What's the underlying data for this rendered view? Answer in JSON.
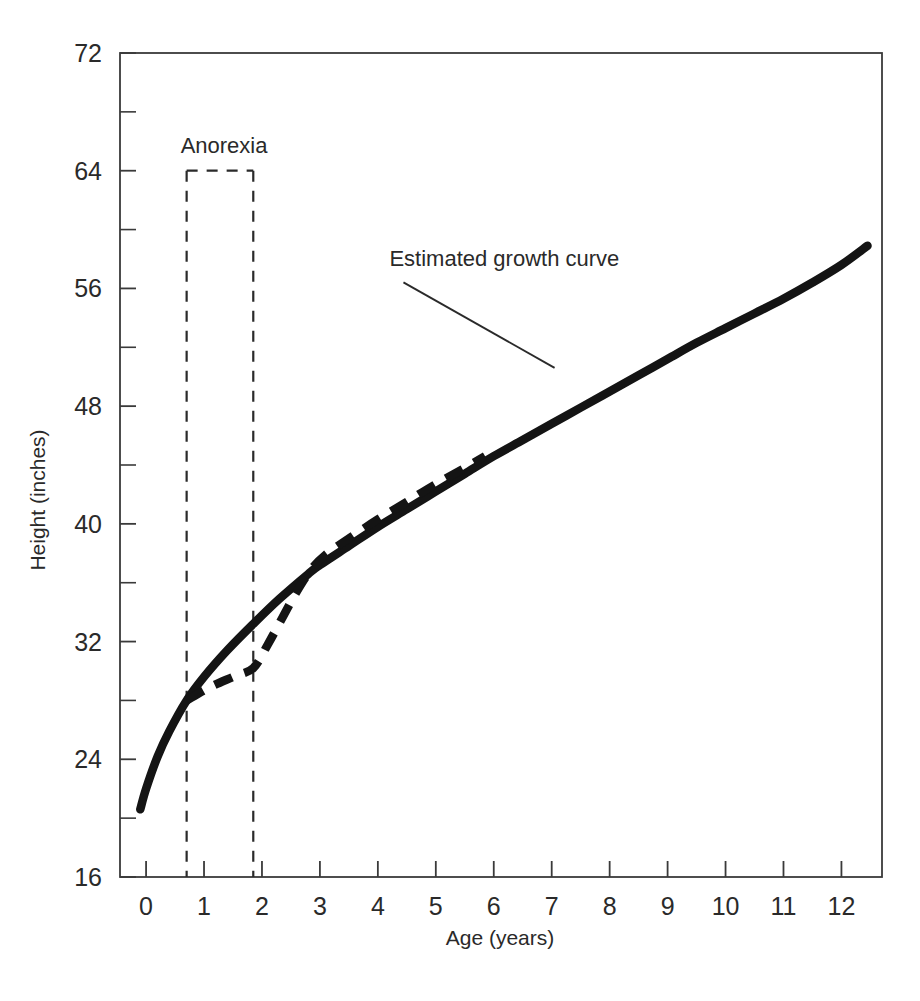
{
  "chart_data": {
    "type": "line",
    "title": "",
    "xlabel": "Age (years)",
    "ylabel": "Height (inches)",
    "xlim": [
      -0.45,
      12.7
    ],
    "ylim": [
      16,
      72
    ],
    "x_ticks": [
      0,
      1,
      2,
      3,
      4,
      5,
      6,
      7,
      8,
      9,
      10,
      11,
      12
    ],
    "x_tick_labels": [
      "0",
      "1",
      "2",
      "3",
      "4",
      "5",
      "6",
      "7",
      "8",
      "9",
      "10",
      "11",
      "12"
    ],
    "y_ticks": [
      16,
      24,
      32,
      40,
      48,
      56,
      64,
      72
    ],
    "y_tick_labels": [
      "16",
      "24",
      "32",
      "40",
      "48",
      "56",
      "64",
      "72"
    ],
    "y_minor_ticks": [
      20,
      28,
      36,
      44,
      52,
      60,
      68
    ],
    "grid": false,
    "legend": "none",
    "series": [
      {
        "name": "Estimated growth curve",
        "style": "solid",
        "color": "#141414",
        "points": [
          [
            -0.1,
            20.6
          ],
          [
            0.0,
            22.0
          ],
          [
            0.2,
            24.2
          ],
          [
            0.4,
            25.9
          ],
          [
            0.7,
            28.0
          ],
          [
            1.0,
            29.6
          ],
          [
            1.4,
            31.4
          ],
          [
            1.85,
            33.2
          ],
          [
            2.3,
            34.9
          ],
          [
            2.8,
            36.6
          ],
          [
            3.0,
            37.2
          ],
          [
            3.5,
            38.5
          ],
          [
            4.0,
            39.8
          ],
          [
            4.5,
            41.0
          ],
          [
            5.0,
            42.2
          ],
          [
            5.5,
            43.4
          ],
          [
            6.0,
            44.6
          ],
          [
            6.5,
            45.7
          ],
          [
            7.0,
            46.8
          ],
          [
            7.5,
            47.9
          ],
          [
            8.0,
            49.0
          ],
          [
            8.5,
            50.1
          ],
          [
            9.0,
            51.2
          ],
          [
            9.5,
            52.3
          ],
          [
            10.0,
            53.3
          ],
          [
            10.5,
            54.3
          ],
          [
            11.0,
            55.3
          ],
          [
            11.5,
            56.4
          ],
          [
            12.0,
            57.6
          ],
          [
            12.45,
            58.9
          ]
        ]
      },
      {
        "name": "Actual growth during anorexia and catch-up",
        "style": "dashed",
        "color": "#141414",
        "points": [
          [
            0.7,
            28.0
          ],
          [
            1.1,
            28.9
          ],
          [
            1.5,
            29.6
          ],
          [
            1.85,
            30.2
          ],
          [
            2.1,
            31.8
          ],
          [
            2.35,
            33.6
          ],
          [
            2.6,
            35.4
          ],
          [
            2.85,
            36.9
          ],
          [
            3.1,
            37.9
          ],
          [
            3.5,
            39.0
          ],
          [
            4.0,
            40.3
          ],
          [
            4.5,
            41.5
          ],
          [
            5.0,
            42.7
          ],
          [
            5.5,
            43.8
          ],
          [
            5.85,
            44.6
          ]
        ]
      }
    ],
    "annotations": [
      {
        "id": "anorexia-box",
        "label": "Anorexia",
        "type": "dashed-rect",
        "x_start": 0.7,
        "x_end": 1.85,
        "y_top": 64,
        "y_bottom": 16
      },
      {
        "id": "estimated-growth-callout",
        "label": "Estimated growth curve",
        "type": "leader-line",
        "text_x": 4.2,
        "text_y": 57.5,
        "target_x": 7.05,
        "target_y": 50.6
      }
    ]
  },
  "axes": {
    "x_axis_label": "Age (years)",
    "y_axis_label": "Height (inches)"
  },
  "colors": {
    "curve": "#141414",
    "frame": "#3a3a3a",
    "text": "#2a2a2a",
    "background": "#ffffff"
  }
}
